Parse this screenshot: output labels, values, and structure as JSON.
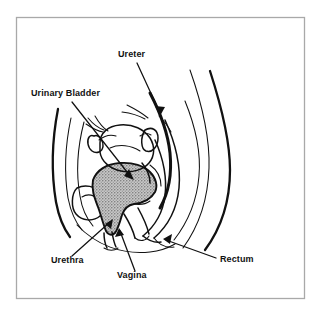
{
  "figure": {
    "background_color": "#ffffff",
    "frame_color": "#a9a9a9",
    "line_color": "#111111",
    "shaded_organ_fill": "#a0a0a0",
    "labels": [
      {
        "id": "ureter",
        "text": "Ureter",
        "x": 118,
        "y": 57,
        "anchor": "start"
      },
      {
        "id": "urinary-bladder",
        "text": "Urinary Bladder",
        "x": 31,
        "y": 96,
        "anchor": "start"
      },
      {
        "id": "urethra",
        "text": "Urethra",
        "x": 51,
        "y": 263,
        "anchor": "start"
      },
      {
        "id": "vagina",
        "text": "Vagina",
        "x": 117,
        "y": 278,
        "anchor": "start"
      },
      {
        "id": "rectum",
        "text": "Rectum",
        "x": 220,
        "y": 262,
        "anchor": "start"
      }
    ],
    "structures": [
      {
        "id": "urinary-bladder-shaded",
        "name": "Urinary Bladder",
        "shaded": true
      },
      {
        "id": "uterus",
        "name": "Uterus",
        "shaded": false
      },
      {
        "id": "ovary",
        "name": "Ovary",
        "shaded": false
      },
      {
        "id": "rectum-canal",
        "name": "Rectum",
        "shaded": false
      },
      {
        "id": "vaginal-canal",
        "name": "Vagina",
        "shaded": false
      },
      {
        "id": "urethral-canal",
        "name": "Urethra",
        "shaded": false
      },
      {
        "id": "pubic-bone",
        "name": "Pubic Bone",
        "shaded": false
      },
      {
        "id": "sacrum",
        "name": "Sacrum",
        "shaded": false
      },
      {
        "id": "abdominal-wall",
        "name": "Abdominal Wall",
        "shaded": false
      }
    ]
  }
}
